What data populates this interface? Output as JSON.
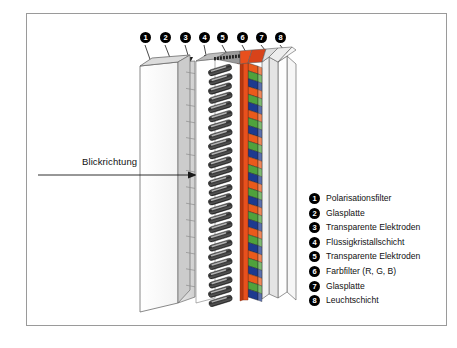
{
  "figure": {
    "title_text": "",
    "view_direction_label": "Blickrichtung",
    "border_color": "#9a9a9a"
  },
  "callouts": [
    {
      "n": "❶",
      "num": "1",
      "x": 140,
      "y": 32
    },
    {
      "n": "❷",
      "num": "2",
      "x": 160,
      "y": 32
    },
    {
      "n": "❸",
      "num": "3",
      "x": 180,
      "y": 32
    },
    {
      "n": "❹",
      "num": "4",
      "x": 199,
      "y": 32
    },
    {
      "n": "❺",
      "num": "5",
      "x": 217,
      "y": 32
    },
    {
      "n": "❻",
      "num": "6",
      "x": 237,
      "y": 32
    },
    {
      "n": "❼",
      "num": "7",
      "x": 256,
      "y": 32
    },
    {
      "n": "❽",
      "num": "8",
      "x": 275,
      "y": 32
    }
  ],
  "legend": {
    "items": [
      {
        "bullet": "❶",
        "label": "Polarisationsfilter"
      },
      {
        "bullet": "❷",
        "label": "Glasplatte"
      },
      {
        "bullet": "❸",
        "label": "Transparente Elektroden"
      },
      {
        "bullet": "❹",
        "label": "Flüssigkristallschicht"
      },
      {
        "bullet": "❺",
        "label": "Transparente Elektroden"
      },
      {
        "bullet": "❻",
        "label": "Farbfilter (R, G, B)"
      },
      {
        "bullet": "❼",
        "label": "Glasplatte"
      },
      {
        "bullet": "❽",
        "label": "Leuchtschicht"
      }
    ]
  },
  "colors": {
    "red_filter": "#ea5a1b",
    "green_filter": "#4fa23c",
    "blue_filter": "#1d3a8f",
    "glass_light": "#f2f2f2",
    "glass_mid": "#dcdcdc",
    "glass_shade": "#c9c9c9",
    "panel_face": "#fbfbfb",
    "outline": "#555555",
    "molecule_dark": "#2a2a2a",
    "molecule_light": "#b8b8b8"
  },
  "chart_data": {
    "type": "diagram",
    "projection": "isometric exploded side view",
    "layer_order_front_to_back": [
      "Polarisationsfilter",
      "Glasplatte",
      "Transparente Elektroden",
      "Flüssigkristallschicht",
      "Transparente Elektroden",
      "Farbfilter (R, G, B)",
      "Glasplatte",
      "Leuchtschicht"
    ],
    "color_filter_sequence": [
      "R",
      "G",
      "B"
    ],
    "color_filter_repeat_count": 10,
    "viewing_direction": "left to right"
  }
}
